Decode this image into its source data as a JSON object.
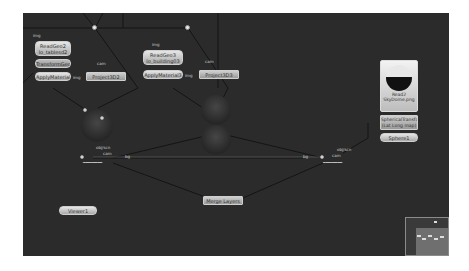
{
  "canvas": {
    "background": "#2b2b2b"
  },
  "nodes": {
    "readgeo2": {
      "line1": "ReadGeo2",
      "line2": "lo_tablesd2"
    },
    "transformgeo2": {
      "label": "TransformGeo2"
    },
    "applymaterial2": {
      "label": "ApplyMaterial2"
    },
    "project3d2": {
      "label": "Project3D2"
    },
    "readgeo3": {
      "line1": "ReadGeo3",
      "line2": "lo_building03"
    },
    "applymaterial3": {
      "label": "ApplyMaterial3"
    },
    "project3d3": {
      "label": "Project3D3"
    },
    "read2": {
      "line1": "Read2",
      "line2": "SkyDome.png"
    },
    "spherical_transform": {
      "line1": "SphericalTransform",
      "line2": "(Lat Long map)"
    },
    "sphere1": {
      "label": "Sphere1"
    },
    "viewer1": {
      "label": "Viewer1"
    },
    "merge_layers": {
      "label": "Merge Layers"
    }
  },
  "pipe_labels": {
    "img1": "img",
    "img2": "img",
    "img3": "img",
    "img4": "img",
    "cam1": "cam",
    "cam2": "cam",
    "obj_scn_left": "obj/scn",
    "obj_scn_right": "obj/scn",
    "cam_left": "cam",
    "cam_right": "cam",
    "bg_left": "bg",
    "bg_right": "bg"
  },
  "minimap": {
    "visible": true
  }
}
